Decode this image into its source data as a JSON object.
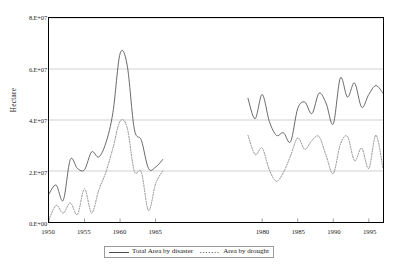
{
  "chart_data": {
    "type": "line",
    "title": "",
    "xlabel": "",
    "ylabel": "Hectare",
    "xlim": [
      1950,
      1997
    ],
    "ylim": [
      0,
      80000000
    ],
    "grid": true,
    "legend_position": "bottom",
    "ytick_labels": [
      "0.E+00",
      "2.E+07",
      "4.E+07",
      "6.E+07",
      "8.E+07"
    ],
    "ytick_values": [
      0,
      20000000,
      40000000,
      60000000,
      80000000
    ],
    "xtick_labels": [
      "1950",
      "1955",
      "1960",
      "1965",
      "1980",
      "1985",
      "1990",
      "1995"
    ],
    "xtick_values": [
      1950,
      1955,
      1960,
      1965,
      1980,
      1985,
      1990,
      1995
    ],
    "series": [
      {
        "name": "Total Area by disaster",
        "style": "solid",
        "color": "#4d4d4d",
        "x": [
          1950,
          1951,
          1952,
          1953,
          1954,
          1955,
          1956,
          1957,
          1958,
          1959,
          1960,
          1961,
          1962,
          1963,
          1964,
          1965,
          1966,
          1978,
          1979,
          1980,
          1981,
          1982,
          1983,
          1984,
          1985,
          1986,
          1987,
          1988,
          1989,
          1990,
          1991,
          1992,
          1993,
          1994,
          1995,
          1996,
          1997
        ],
        "values": [
          11000000,
          14500000,
          8500000,
          24500000,
          21000000,
          20500000,
          27500000,
          25500000,
          31000000,
          43000000,
          66000000,
          61500000,
          36500000,
          32000000,
          21000000,
          21500000,
          24500000,
          48500000,
          40500000,
          50000000,
          39500000,
          34000000,
          35000000,
          31500000,
          44500000,
          47000000,
          42500000,
          50500000,
          46500000,
          38500000,
          56500000,
          49000000,
          54500000,
          45000000,
          50000000,
          53500000,
          50500000
        ]
      },
      {
        "name": "Area by drought",
        "style": "dotted",
        "color": "#7a7a7a",
        "x": [
          1950,
          1951,
          1952,
          1953,
          1954,
          1955,
          1956,
          1957,
          1958,
          1959,
          1960,
          1961,
          1962,
          1963,
          1964,
          1965,
          1966,
          1978,
          1979,
          1980,
          1981,
          1982,
          1983,
          1984,
          1985,
          1986,
          1987,
          1988,
          1989,
          1990,
          1991,
          1992,
          1993,
          1994,
          1995,
          1996,
          1997
        ],
        "values": [
          1000000,
          6500000,
          3500000,
          7500000,
          3000000,
          13000000,
          3500000,
          12500000,
          19500000,
          29000000,
          39500000,
          37000000,
          20000000,
          19500000,
          4500000,
          15000000,
          20000000,
          34000000,
          26500000,
          29000000,
          20500000,
          16000000,
          19500000,
          26000000,
          33000000,
          28500000,
          32000000,
          33500000,
          26000000,
          19000000,
          30500000,
          33500000,
          24000000,
          29000000,
          21000000,
          34000000,
          21000000
        ]
      }
    ]
  },
  "legend": {
    "items": [
      {
        "label": "Total Area by disaster",
        "style": "solid"
      },
      {
        "label": "Area by drought",
        "style": "dotted"
      }
    ]
  }
}
